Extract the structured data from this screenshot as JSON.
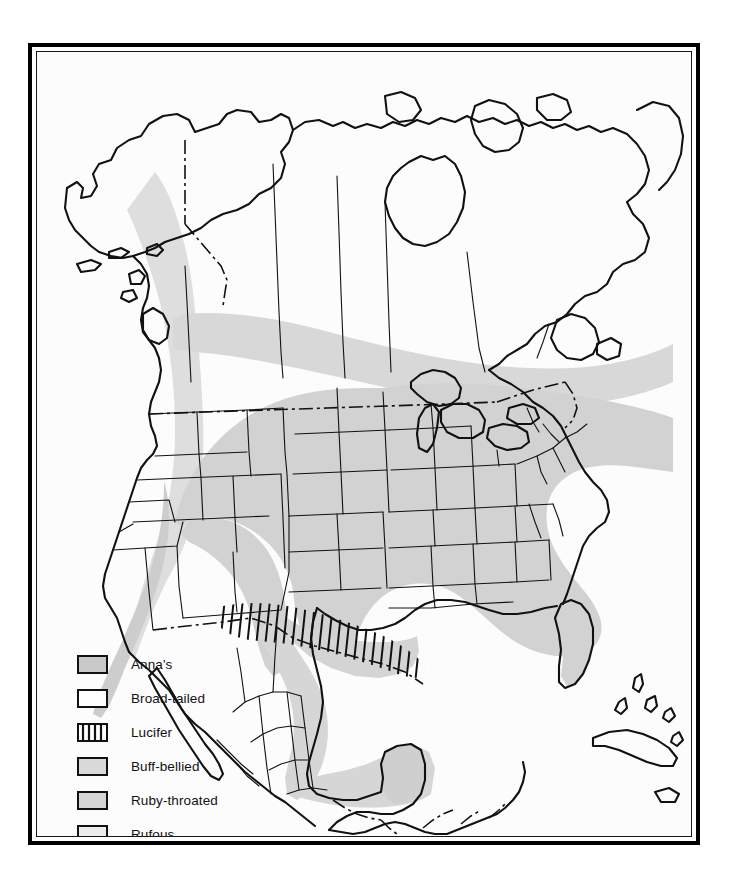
{
  "figure": {
    "background_color": "#ffffff",
    "frame_color": "#000000",
    "map_fill": "#fcfcfc"
  },
  "legend": {
    "items": [
      {
        "label": "Anna's",
        "swatch": "solid-gray",
        "color": "#c9c9c9"
      },
      {
        "label": "Broad-tailed",
        "swatch": "white",
        "color": "#ffffff"
      },
      {
        "label": "Lucifer",
        "swatch": "vertical-hatch",
        "color": "#ffffff"
      },
      {
        "label": "Buff-bellied",
        "swatch": "solid-gray",
        "color": "#dadada"
      },
      {
        "label": "Ruby-throated",
        "swatch": "solid-gray",
        "color": "#d5d5d5"
      },
      {
        "label": "Rufous",
        "swatch": "light-gray",
        "color": "#ececec"
      }
    ]
  },
  "map": {
    "regions": [
      {
        "name": "ruby-throated-range",
        "description": "Eastern United States and southeastern Canada shading",
        "fill": "#d2d2d2"
      },
      {
        "name": "rufous-range",
        "description": "Pacific Northwest coastal band from Alaska panhandle to California",
        "fill": "#dcdcdc"
      },
      {
        "name": "annas-range",
        "description": "California and Pacific coast",
        "fill": "#cfcfcf"
      },
      {
        "name": "buff-bellied-range",
        "description": "Gulf coast of Mexico and Yucatan peninsula",
        "fill": "#d6d6d6"
      },
      {
        "name": "lucifer-range",
        "description": "Vertical hatching over southern Arizona, New Mexico and west Texas into northern Mexico",
        "fill": "none"
      },
      {
        "name": "broad-tailed-range",
        "description": "Interior western mountain states, unshaded white",
        "fill": "#ffffff"
      }
    ],
    "boundaries": {
      "coastline": "solid",
      "state_province": "solid-thin",
      "international": "dash-dot"
    }
  }
}
